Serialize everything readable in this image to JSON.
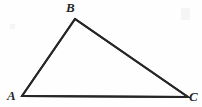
{
  "figure": {
    "type": "geometry-diagram",
    "shape": "triangle",
    "title": "",
    "background_color": "#fefefe",
    "stroke_color": "#262626",
    "stroke_width": 2,
    "label_color": "#262626",
    "width": 202,
    "height": 107,
    "vertices": [
      {
        "id": "A",
        "label": "A",
        "x": 22,
        "y": 96,
        "label_x": 7,
        "label_y": 89,
        "position": "bottom-left"
      },
      {
        "id": "B",
        "label": "B",
        "x": 75,
        "y": 19,
        "label_x": 66,
        "label_y": 1,
        "position": "top"
      },
      {
        "id": "C",
        "label": "C",
        "x": 188,
        "y": 97,
        "label_x": 189,
        "label_y": 90,
        "position": "bottom-right"
      }
    ],
    "edges": [
      {
        "id": "AB",
        "from": "A",
        "to": "B"
      },
      {
        "id": "BC",
        "from": "B",
        "to": "C"
      },
      {
        "id": "CA",
        "from": "C",
        "to": "A"
      }
    ],
    "polygon_points": "22,96 75,19 188,97"
  }
}
